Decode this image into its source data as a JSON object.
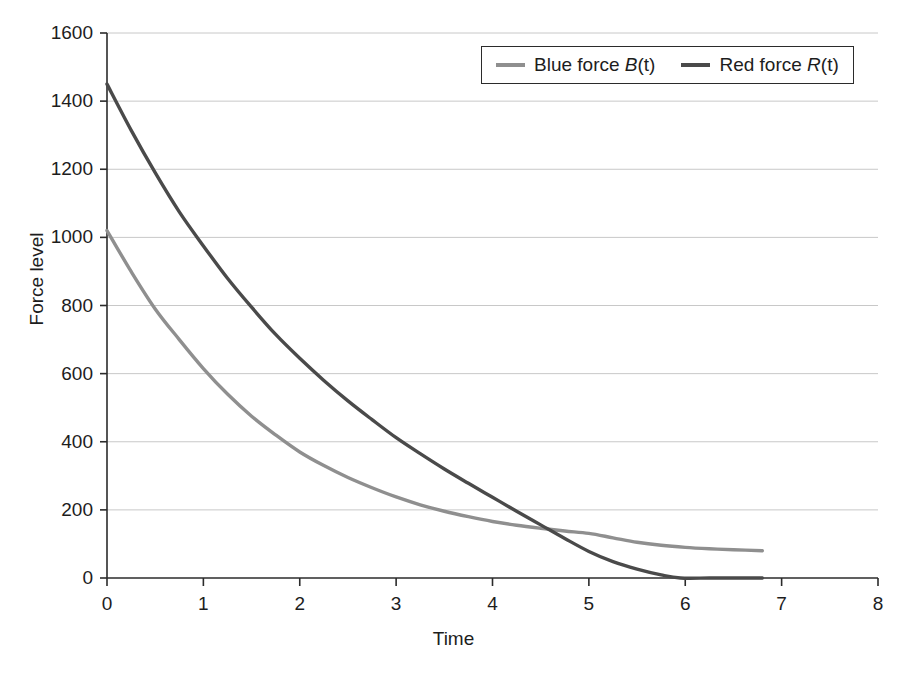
{
  "chart_data": {
    "type": "line",
    "title": "",
    "xlabel": "Time",
    "ylabel": "Force level",
    "xlim": [
      0,
      8
    ],
    "ylim": [
      0,
      1600
    ],
    "xticks": [
      0,
      1,
      2,
      3,
      4,
      5,
      6,
      7,
      8
    ],
    "yticks": [
      0,
      200,
      400,
      600,
      800,
      1000,
      1200,
      1400,
      1600
    ],
    "grid": "horizontal",
    "legend_position": "top-right",
    "series": [
      {
        "name": "Blue force B(t)",
        "label_plain": "Blue force ",
        "label_var": "B",
        "label_suffix": "(t)",
        "color": "#8f8f8f",
        "x": [
          0,
          0.25,
          0.5,
          0.75,
          1,
          1.25,
          1.5,
          1.75,
          2,
          2.25,
          2.5,
          2.75,
          3,
          3.25,
          3.5,
          3.75,
          4,
          4.25,
          4.5,
          4.75,
          5,
          5.25,
          5.5,
          5.75,
          6,
          6.25,
          6.5,
          6.8
        ],
        "values": [
          1020,
          900,
          790,
          700,
          615,
          540,
          475,
          420,
          370,
          330,
          295,
          265,
          238,
          215,
          196,
          180,
          166,
          155,
          146,
          138,
          131,
          118,
          105,
          96,
          90,
          86,
          83,
          80
        ]
      },
      {
        "name": "Red force R(t)",
        "label_plain": "Red force ",
        "label_var": "R",
        "label_suffix": "(t)",
        "color": "#4a4a4a",
        "x": [
          0,
          0.25,
          0.5,
          0.75,
          1,
          1.25,
          1.5,
          1.75,
          2,
          2.25,
          2.5,
          2.75,
          3,
          3.25,
          3.5,
          3.75,
          4,
          4.25,
          4.5,
          4.75,
          5,
          5.25,
          5.5,
          5.75,
          5.95,
          6.25,
          6.5,
          6.8
        ],
        "values": [
          1450,
          1315,
          1190,
          1075,
          975,
          880,
          795,
          715,
          645,
          580,
          520,
          465,
          412,
          365,
          320,
          278,
          237,
          196,
          156,
          116,
          78,
          48,
          26,
          9,
          0,
          0,
          0,
          0
        ]
      }
    ]
  },
  "axes": {
    "y_label": "Force level",
    "x_label": "Time",
    "y_tick_labels": [
      "1600",
      "1400",
      "1200",
      "1000",
      "800",
      "600",
      "400",
      "200",
      "0"
    ],
    "x_tick_labels": [
      "0",
      "1",
      "2",
      "3",
      "4",
      "5",
      "6",
      "7",
      "8"
    ]
  },
  "legend": {
    "items": [
      {
        "prefix": "Blue force ",
        "variable": "B",
        "suffix": "(t)",
        "color": "#8f8f8f"
      },
      {
        "prefix": "Red force ",
        "variable": "R",
        "suffix": "(t)",
        "color": "#4a4a4a"
      }
    ]
  },
  "style": {
    "background": "#ffffff",
    "axis_color": "#2b2b2b",
    "grid_color": "#c8c8c8"
  }
}
